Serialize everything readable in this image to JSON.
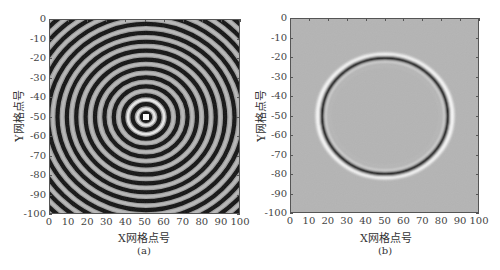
{
  "chart_data": [
    {
      "type": "heatmap",
      "panel": "a",
      "caption": "(a)",
      "title": "",
      "xlabel": "X网格点号",
      "ylabel": "Y网格点号",
      "xlim": [
        0,
        100
      ],
      "ylim": [
        -100,
        0
      ],
      "xticks": [
        0,
        10,
        20,
        30,
        40,
        50,
        60,
        70,
        80,
        90,
        100
      ],
      "yticks": [
        0,
        -10,
        -20,
        -30,
        -40,
        -50,
        -60,
        -70,
        -80,
        -90,
        -100
      ],
      "description": "Concentric circular wave rings (grayscale) centered at approximately (50, -50) with a bright white source point at center",
      "source_point": [
        50,
        -50
      ],
      "colormap": "gray"
    },
    {
      "type": "heatmap",
      "panel": "b",
      "caption": "(b)",
      "title": "",
      "xlabel": "X网格点号",
      "ylabel": "Y网格点号",
      "xlim": [
        0,
        100
      ],
      "ylim": [
        -100,
        0
      ],
      "xticks": [
        0,
        10,
        20,
        30,
        40,
        50,
        60,
        70,
        80,
        90,
        100
      ],
      "yticks": [
        0,
        -10,
        -20,
        -30,
        -40,
        -50,
        -60,
        -70,
        -80,
        -90,
        -100
      ],
      "description": "Single circular wavefront (black ring with white halo) on gray background, centered near (50, -50), spanning x≈17–85 and y≈-20 to -80",
      "ring_center": [
        50,
        -50
      ],
      "ring_x_extent": [
        17,
        85
      ],
      "ring_y_extent": [
        -20,
        -80
      ],
      "colormap": "gray"
    }
  ],
  "panels": {
    "a": {
      "caption": "(a)",
      "xlabel": "X网格点号",
      "ylabel": "Y网格点号"
    },
    "b": {
      "caption": "(b)",
      "xlabel": "X网格点号",
      "ylabel": "Y网格点号"
    }
  },
  "ticks": {
    "x": [
      "0",
      "10",
      "20",
      "30",
      "40",
      "50",
      "60",
      "70",
      "80",
      "90",
      "100"
    ],
    "y": [
      "0",
      "-10",
      "-20",
      "-30",
      "-40",
      "-50",
      "-60",
      "-70",
      "-80",
      "-90",
      "-100"
    ]
  },
  "colors": {
    "background_gray": "#a8a8a8",
    "ring_dark": "#111111",
    "ring_light": "#f4f4f4"
  }
}
